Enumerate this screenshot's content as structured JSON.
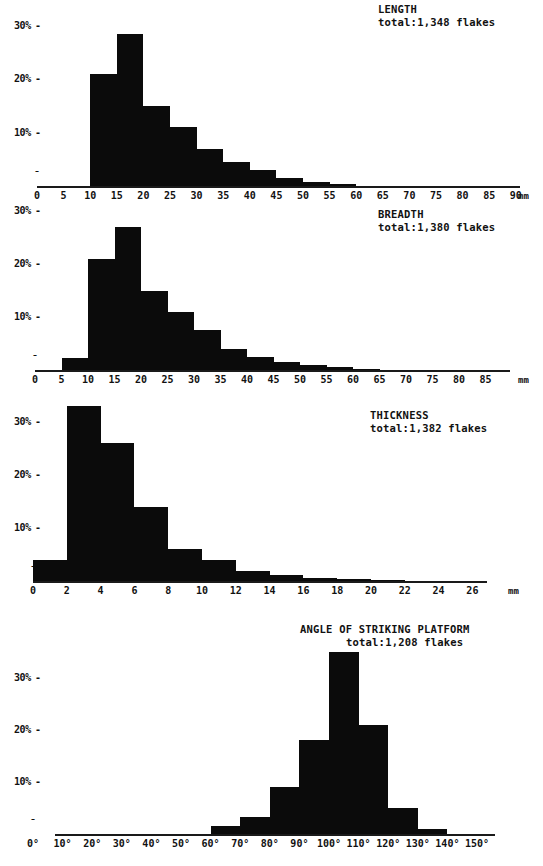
{
  "chart_data": [
    {
      "type": "bar",
      "title": "LENGTH",
      "total_label": "total:1,348 flakes",
      "xlabel": "mm",
      "ylabel": "%",
      "unit": "mm",
      "categories": [
        "0-5",
        "5-10",
        "10-15",
        "15-20",
        "20-25",
        "25-30",
        "30-35",
        "35-40",
        "40-45",
        "45-50",
        "50-55",
        "55-60",
        "60-65",
        "65-70",
        "70-75",
        "75-80",
        "80-85",
        "85-90"
      ],
      "bin_starts": [
        0,
        5,
        10,
        15,
        20,
        25,
        30,
        35,
        40,
        45,
        50,
        55,
        60,
        65,
        70,
        75,
        80,
        85
      ],
      "bin_width": 5,
      "values": [
        0,
        0,
        21.0,
        28.5,
        15.0,
        11.0,
        7.0,
        4.5,
        3.0,
        1.5,
        0.7,
        0.3,
        0,
        0,
        0,
        0,
        0,
        0
      ],
      "xticks": [
        "0",
        "5",
        "10",
        "15",
        "20",
        "25",
        "30",
        "35",
        "40",
        "45",
        "50",
        "55",
        "60",
        "65",
        "70",
        "75",
        "80",
        "85",
        "90"
      ],
      "xtick_values": [
        0,
        5,
        10,
        15,
        20,
        25,
        30,
        35,
        40,
        45,
        50,
        55,
        60,
        65,
        70,
        75,
        80,
        85,
        90
      ],
      "yticks": [
        "10%",
        "20%",
        "30%"
      ],
      "ytick_values": [
        10,
        20,
        30
      ],
      "xlim": [
        0,
        90
      ],
      "ylim": [
        0,
        35
      ],
      "grid": false,
      "legend": "none"
    },
    {
      "type": "bar",
      "title": "BREADTH",
      "total_label": "total:1,380 flakes",
      "xlabel": "mm",
      "ylabel": "%",
      "unit": "mm",
      "categories": [
        "0-5",
        "5-10",
        "10-15",
        "15-20",
        "20-25",
        "25-30",
        "30-35",
        "35-40",
        "40-45",
        "45-50",
        "50-55",
        "55-60",
        "60-65",
        "65-70",
        "70-75",
        "75-80",
        "80-85"
      ],
      "bin_starts": [
        0,
        5,
        10,
        15,
        20,
        25,
        30,
        35,
        40,
        45,
        50,
        55,
        60,
        65,
        70,
        75,
        80
      ],
      "bin_width": 5,
      "values": [
        0,
        2.2,
        21.0,
        27.0,
        15.0,
        11.0,
        7.5,
        4.0,
        2.5,
        1.6,
        1.0,
        0.5,
        0.2,
        0,
        0,
        0,
        0
      ],
      "xticks": [
        "0",
        "5",
        "10",
        "15",
        "20",
        "25",
        "30",
        "35",
        "40",
        "45",
        "50",
        "55",
        "60",
        "65",
        "70",
        "75",
        "80",
        "85"
      ],
      "xtick_values": [
        0,
        5,
        10,
        15,
        20,
        25,
        30,
        35,
        40,
        45,
        50,
        55,
        60,
        65,
        70,
        75,
        80,
        85
      ],
      "yticks": [
        "10%",
        "20%",
        "30%"
      ],
      "ytick_values": [
        10,
        20,
        30
      ],
      "xlim": [
        0,
        85
      ],
      "ylim": [
        0,
        35
      ],
      "grid": false,
      "legend": "none"
    },
    {
      "type": "bar",
      "title": "THICKNESS",
      "total_label": "total:1,382 flakes",
      "xlabel": "mm",
      "ylabel": "%",
      "unit": "mm",
      "categories": [
        "0-2",
        "2-4",
        "4-6",
        "6-8",
        "8-10",
        "10-12",
        "12-14",
        "14-16",
        "16-18",
        "18-20",
        "20-22",
        "22-24",
        "24-26"
      ],
      "bin_starts": [
        0,
        2,
        4,
        6,
        8,
        10,
        12,
        14,
        16,
        18,
        20,
        22,
        24
      ],
      "bin_width": 2,
      "values": [
        4.0,
        33.0,
        26.0,
        14.0,
        6.0,
        4.0,
        1.8,
        1.2,
        0.6,
        0.3,
        0.2,
        0,
        0
      ],
      "xticks": [
        "0",
        "2",
        "4",
        "6",
        "8",
        "10",
        "12",
        "14",
        "16",
        "18",
        "20",
        "22",
        "24",
        "26"
      ],
      "xtick_values": [
        0,
        2,
        4,
        6,
        8,
        10,
        12,
        14,
        16,
        18,
        20,
        22,
        24,
        26
      ],
      "yticks": [
        "10%",
        "20%",
        "30%"
      ],
      "ytick_values": [
        10,
        20,
        30
      ],
      "xlim": [
        0,
        26
      ],
      "ylim": [
        0,
        36
      ],
      "grid": false,
      "legend": "none"
    },
    {
      "type": "bar",
      "title": "ANGLE OF STRIKING PLATFORM",
      "total_label": "total:1,208 flakes",
      "xlabel": "degrees",
      "ylabel": "%",
      "unit": "",
      "categories": [
        "0-10",
        "10-20",
        "20-30",
        "30-40",
        "40-50",
        "50-60",
        "60-70",
        "70-80",
        "80-90",
        "90-100",
        "100-110",
        "110-120",
        "120-130",
        "130-140",
        "140-150"
      ],
      "bin_starts": [
        0,
        10,
        20,
        30,
        40,
        50,
        60,
        70,
        80,
        90,
        100,
        110,
        120,
        130,
        140
      ],
      "bin_width": 10,
      "values": [
        0,
        0,
        0,
        0,
        0,
        0,
        1.5,
        3.2,
        9.0,
        18.0,
        35.0,
        21.0,
        5.0,
        1.0,
        0
      ],
      "xticks": [
        "0°",
        "10°",
        "20°",
        "30°",
        "40°",
        "50°",
        "60°",
        "70°",
        "80°",
        "90°",
        "100°",
        "110°",
        "120°",
        "130°",
        "140°",
        "150°"
      ],
      "xtick_values": [
        0,
        10,
        20,
        30,
        40,
        50,
        60,
        70,
        80,
        90,
        100,
        110,
        120,
        130,
        140,
        150
      ],
      "yticks": [
        "10%",
        "20%",
        "30%"
      ],
      "ytick_values": [
        10,
        20,
        30
      ],
      "xlim": [
        0,
        150
      ],
      "ylim": [
        0,
        38
      ],
      "grid": false,
      "legend": "none"
    }
  ],
  "figure": {
    "bar_color": "#0b0b0b",
    "axis_color": "#1a1a1a",
    "background": "#ffffff",
    "zero_mark": "0"
  }
}
